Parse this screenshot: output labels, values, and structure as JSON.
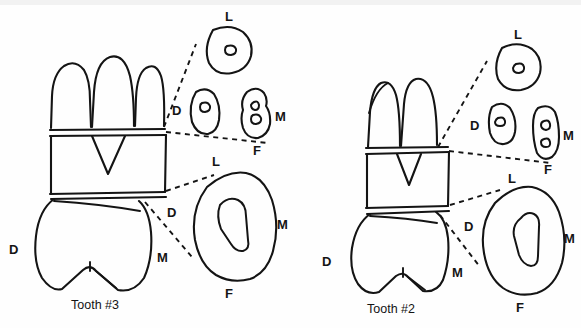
{
  "figure": {
    "background_color": "#fefefe",
    "ink_color": "#141414",
    "width": 581,
    "height": 328
  },
  "specimens": [
    {
      "id": "tooth-3",
      "name_label": "Tooth #3",
      "roots_visible": 3,
      "surface_labels": {
        "distal": "D",
        "mesial": "M",
        "lingual": "L",
        "facial": "F"
      },
      "longitudinal_view": {
        "distal_label": "D"
      },
      "root_cross_section": {
        "caption_lingual": "L",
        "caption_distal": "D",
        "caption_mesial": "M",
        "caption_facial": "F",
        "sections": [
          {
            "name": "lingual-root",
            "canals": 1
          },
          {
            "name": "distal-root",
            "canals": 1
          },
          {
            "name": "mesiobuccal-root",
            "canals": 2
          }
        ]
      },
      "crown_cross_section": {
        "caption_lingual": "L",
        "caption_distal": "D",
        "caption_mesial": "M",
        "caption_facial": "F",
        "pulp_chamber_shape": "boot"
      }
    },
    {
      "id": "tooth-2",
      "name_label": "Tooth #2",
      "roots_visible": 2,
      "surface_labels": {
        "distal": "D",
        "mesial": "M",
        "lingual": "L",
        "facial": "F"
      },
      "longitudinal_view": {
        "distal_label": "D"
      },
      "root_cross_section": {
        "caption_lingual": "L",
        "caption_distal": "D",
        "caption_mesial": "M",
        "caption_facial": "F",
        "sections": [
          {
            "name": "lingual-root",
            "canals": 1
          },
          {
            "name": "distal-root",
            "canals": 1
          },
          {
            "name": "mesiobuccal-root",
            "canals": 2
          }
        ]
      },
      "crown_cross_section": {
        "caption_lingual": "L",
        "caption_distal": "D",
        "caption_mesial": "M",
        "caption_facial": "F",
        "pulp_chamber_shape": "boot"
      }
    }
  ]
}
